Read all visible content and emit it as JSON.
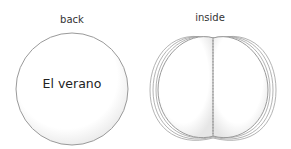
{
  "labels": {
    "back": "back",
    "inside": "inside"
  },
  "back_cover": {
    "title": "El verano"
  },
  "colors": {
    "outline": "#9a9a9a",
    "fill": "#ffffff",
    "shade": "#e8e8e8"
  }
}
